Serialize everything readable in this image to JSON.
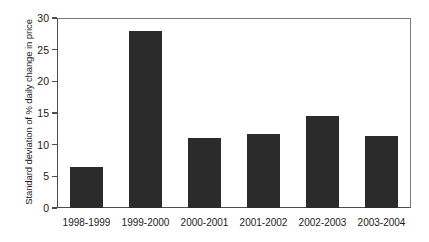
{
  "chart_data": {
    "type": "bar",
    "title": "",
    "xlabel": "",
    "ylabel": "Standard deviation of % daily change in price",
    "categories": [
      "1998-1999",
      "1999-2000",
      "2000-2001",
      "2001-2002",
      "2002-2003",
      "2003-2004"
    ],
    "values": [
      6.5,
      28.0,
      11.1,
      11.7,
      14.6,
      11.3
    ],
    "ylim": [
      0,
      30
    ],
    "yticks": [
      "0",
      "5",
      "10",
      "15",
      "20",
      "25",
      "30"
    ],
    "ytick_values": [
      0,
      5,
      10,
      15,
      20,
      25,
      30
    ],
    "grid": false,
    "legend": false,
    "bar_color": "#2b2b2b",
    "axis_color": "#4d4d4d",
    "background": "#ffffff"
  }
}
